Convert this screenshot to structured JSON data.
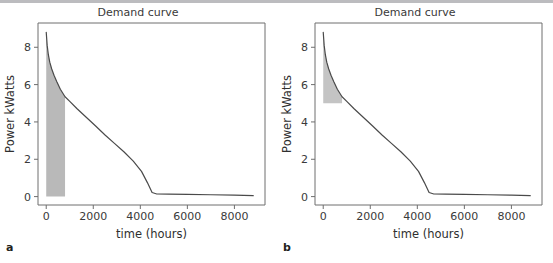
{
  "figure": {
    "width": 553,
    "height": 263,
    "background": "#ffffff",
    "top_rule_color": "#bcbcbf"
  },
  "panels": [
    {
      "key": "a",
      "label": "a",
      "title": "Demand curve",
      "shading_note": "shaded region from x=0 to x=800 down to y=0"
    },
    {
      "key": "b",
      "label": "b",
      "title": "Demand curve",
      "shading_note": "shaded wedge from x=0 to x=800 between y=5 and the curve"
    }
  ],
  "chart_data": [
    {
      "type": "line",
      "panel": "a",
      "title": "Demand curve",
      "xlabel": "time (hours)",
      "ylabel": "Power kWatts",
      "xlim": [
        -350,
        9300
      ],
      "ylim": [
        -0.45,
        9.3
      ],
      "xticks": [
        0,
        2000,
        4000,
        6000,
        8000
      ],
      "xticklabels": [
        "0",
        "2000",
        "4000",
        "6000",
        "8000"
      ],
      "yticks": [
        0,
        2,
        4,
        6,
        8
      ],
      "yticklabels": [
        "0",
        "2",
        "4",
        "6",
        "8"
      ],
      "grid": false,
      "legend": null,
      "line_color": "#4a4a4a",
      "fill_color": "#b9b9b9",
      "x": [
        0,
        40,
        90,
        150,
        230,
        330,
        450,
        600,
        800,
        1000,
        1300,
        1700,
        2100,
        2500,
        2900,
        3300,
        3700,
        4050,
        4300,
        4500,
        4700,
        5200,
        6000,
        7000,
        8000,
        8800
      ],
      "y": [
        8.8,
        8.1,
        7.6,
        7.2,
        6.85,
        6.5,
        6.15,
        5.75,
        5.35,
        5.1,
        4.72,
        4.25,
        3.78,
        3.3,
        2.85,
        2.4,
        1.9,
        1.35,
        0.75,
        0.22,
        0.14,
        0.13,
        0.12,
        0.1,
        0.08,
        0.05
      ],
      "fill_region": {
        "x_start": 0,
        "x_end": 800,
        "y_base": 0,
        "description": "area under curve from t=0 to t=800 down to zero"
      }
    },
    {
      "type": "line",
      "panel": "b",
      "title": "Demand curve",
      "xlabel": "time (hours)",
      "ylabel": "Power kWatts",
      "xlim": [
        -350,
        9300
      ],
      "ylim": [
        -0.45,
        9.3
      ],
      "xticks": [
        0,
        2000,
        4000,
        6000,
        8000
      ],
      "xticklabels": [
        "0",
        "2000",
        "4000",
        "6000",
        "8000"
      ],
      "yticks": [
        0,
        2,
        4,
        6,
        8
      ],
      "yticklabels": [
        "0",
        "2",
        "4",
        "6",
        "8"
      ],
      "grid": false,
      "legend": null,
      "line_color": "#4a4a4a",
      "fill_color": "#c4c4c4",
      "x": [
        0,
        40,
        90,
        150,
        230,
        330,
        450,
        600,
        800,
        1000,
        1300,
        1700,
        2100,
        2500,
        2900,
        3300,
        3700,
        4050,
        4300,
        4500,
        4700,
        5200,
        6000,
        7000,
        8000,
        8800
      ],
      "y": [
        8.8,
        8.1,
        7.6,
        7.2,
        6.85,
        6.5,
        6.15,
        5.75,
        5.35,
        5.1,
        4.72,
        4.25,
        3.78,
        3.3,
        2.85,
        2.4,
        1.9,
        1.35,
        0.75,
        0.22,
        0.14,
        0.13,
        0.12,
        0.1,
        0.08,
        0.05
      ],
      "fill_region": {
        "x_start": 0,
        "x_end": 800,
        "y_base": 5,
        "description": "area between curve and the 5 kW baseline from t=0 to t=800"
      }
    }
  ]
}
